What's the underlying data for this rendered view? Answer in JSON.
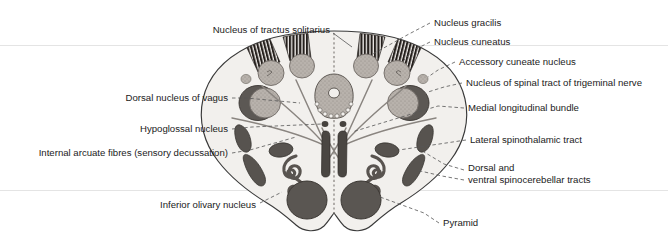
{
  "figure": {
    "type": "anatomical-diagram",
    "region": "medulla oblongata (level of sensory decussation)",
    "background_color": "#ffffff",
    "outline_color": "#3a3a3a",
    "tissue_fill": "#f2f0ed",
    "gray_nucleus_color": "#b9b3ae",
    "dark_tract_color": "#6e6a66",
    "hatch_color": "#2e2b28"
  },
  "labels_left": [
    {
      "id": "nucleus-of-tractus-solitarius",
      "text": "Nucleus of tractus solitarius",
      "x": 330,
      "y": 30,
      "anchor": "end"
    },
    {
      "id": "dorsal-nucleus-of-vagus",
      "text": "Dorsal nucleus of vagus",
      "x": 228,
      "y": 98,
      "anchor": "end"
    },
    {
      "id": "hypoglossal-nucleus",
      "text": "Hypoglossal nucleus",
      "x": 228,
      "y": 129,
      "anchor": "end"
    },
    {
      "id": "internal-arcuate-fibres",
      "text": "Internal arcuate fibres (sensory decussation)",
      "x": 228,
      "y": 153,
      "anchor": "end"
    },
    {
      "id": "inferior-olivary-nucleus",
      "text": "Inferior olivary nucleus",
      "x": 256,
      "y": 205,
      "anchor": "end"
    }
  ],
  "labels_right": [
    {
      "id": "nucleus-gracilis",
      "text": "Nucleus gracilis",
      "x": 434,
      "y": 23,
      "anchor": "start"
    },
    {
      "id": "nucleus-cuneatus",
      "text": "Nucleus cuneatus",
      "x": 434,
      "y": 42,
      "anchor": "start"
    },
    {
      "id": "accessory-cuneate-nucleus",
      "text": "Accessory cuneate nucleus",
      "x": 459,
      "y": 62,
      "anchor": "start"
    },
    {
      "id": "nucleus-of-spinal-tract-of-trigeminal-nerve",
      "text": "Nucleus of spinal tract of trigeminal nerve",
      "x": 466,
      "y": 83,
      "anchor": "start"
    },
    {
      "id": "medial-longitudinal-bundle",
      "text": "Medial longitudinal bundle",
      "x": 468,
      "y": 108,
      "anchor": "start"
    },
    {
      "id": "lateral-spinothalamic-tract",
      "text": "Lateral spinothalamic tract",
      "x": 470,
      "y": 140,
      "anchor": "start"
    },
    {
      "id": "dorsal-and-ventral-spinocerebellar-tracts-line1",
      "text": "Dorsal and",
      "x": 468,
      "y": 168,
      "anchor": "start"
    },
    {
      "id": "dorsal-and-ventral-spinocerebellar-tracts-line2",
      "text": "ventral spinocerebellar tracts",
      "x": 468,
      "y": 180,
      "anchor": "start"
    },
    {
      "id": "pyramid",
      "text": "Pyramid",
      "x": 443,
      "y": 223,
      "anchor": "start"
    }
  ]
}
